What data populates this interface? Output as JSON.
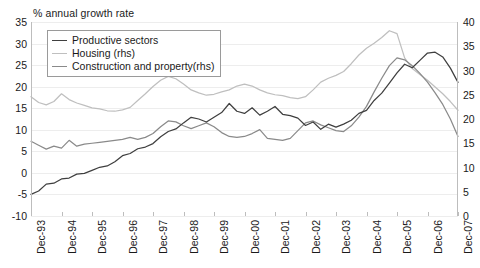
{
  "chart_data": {
    "type": "line",
    "title": "% annual growth rate",
    "xlabel": "",
    "ylabel": "% annual growth rate",
    "ylabel_right": "",
    "grid": true,
    "legend_position": "top-left",
    "ylim": [
      -10,
      35
    ],
    "ylim_right": [
      0,
      40
    ],
    "yticks": [
      35,
      30,
      25,
      20,
      15,
      10,
      5,
      0,
      -5,
      -10
    ],
    "yticks_right": [
      40,
      35,
      30,
      25,
      20,
      15,
      10,
      5,
      0
    ],
    "categories": [
      "Dec-93",
      "Dec-94",
      "Dec-95",
      "Dec-96",
      "Dec-97",
      "Dec-98",
      "Dec-99",
      "Dec-00",
      "Dec-01",
      "Dec-02",
      "Dec-03",
      "Dec-04",
      "Dec-05",
      "Dec-06",
      "Dec-07"
    ],
    "x_tick_labels": [
      "Dec-93",
      "Dec-94",
      "Dec-95",
      "Dec-96",
      "Dec-97",
      "Dec-98",
      "Dec-99",
      "Dec-00",
      "Dec-01",
      "Dec-02",
      "Dec-03",
      "Dec-04",
      "Dec-05",
      "Dec-06",
      "Dec-07"
    ],
    "x_start": "Dec-93",
    "x_end": "Dec-07",
    "series": [
      {
        "name": "Productive sectors",
        "axis": "left",
        "color": "#3f3f3f",
        "x": [
          0.0,
          0.25,
          0.5,
          0.75,
          1.0,
          1.25,
          1.5,
          1.75,
          2.0,
          2.25,
          2.5,
          2.75,
          3.0,
          3.25,
          3.5,
          3.75,
          4.0,
          4.25,
          4.5,
          4.75,
          5.0,
          5.25,
          5.5,
          5.75,
          6.0,
          6.25,
          6.5,
          6.75,
          7.0,
          7.25,
          7.5,
          7.75,
          8.0,
          8.25,
          8.5,
          8.75,
          9.0,
          9.25,
          9.5,
          9.75,
          10.0,
          10.25,
          10.5,
          10.75,
          11.0,
          11.25,
          11.5,
          11.75,
          12.0,
          12.25,
          12.5,
          12.75,
          13.0,
          13.25,
          13.5,
          13.75,
          14.0
        ],
        "values": [
          -5.0,
          -4.2,
          -2.6,
          -2.4,
          -1.4,
          -1.2,
          -0.3,
          -0.1,
          0.6,
          1.3,
          1.6,
          2.6,
          4.0,
          4.5,
          5.6,
          6.0,
          6.8,
          8.4,
          9.6,
          10.2,
          11.6,
          12.9,
          12.5,
          11.8,
          12.9,
          14.0,
          16.1,
          14.3,
          13.8,
          15.1,
          13.4,
          14.3,
          15.4,
          13.6,
          13.3,
          12.7,
          11.0,
          11.8,
          10.1,
          11.3,
          10.6,
          11.3,
          12.2,
          13.8,
          14.5,
          16.8,
          18.5,
          20.8,
          23.2,
          25.2,
          24.4,
          26.1,
          27.8,
          28.0,
          26.9,
          24.3,
          21.0
        ],
        "y_unit": "% annual growth"
      },
      {
        "name": "Housing (rhs)",
        "axis": "right",
        "color": "#bfbfbf",
        "x": [
          0.0,
          0.25,
          0.5,
          0.75,
          1.0,
          1.25,
          1.5,
          1.75,
          2.0,
          2.25,
          2.5,
          2.75,
          3.0,
          3.25,
          3.5,
          3.75,
          4.0,
          4.25,
          4.5,
          4.75,
          5.0,
          5.25,
          5.5,
          5.75,
          6.0,
          6.25,
          6.5,
          6.75,
          7.0,
          7.25,
          7.5,
          7.75,
          8.0,
          8.25,
          8.5,
          8.75,
          9.0,
          9.25,
          9.5,
          9.75,
          10.0,
          10.25,
          10.5,
          10.75,
          11.0,
          11.25,
          11.5,
          11.75,
          12.0,
          12.25,
          12.5,
          12.75,
          13.0,
          13.25,
          13.5,
          13.75,
          14.0
        ],
        "values": [
          24.6,
          23.4,
          22.9,
          23.6,
          25.2,
          24.0,
          23.3,
          22.8,
          22.3,
          22.1,
          21.7,
          21.6,
          21.9,
          22.4,
          23.8,
          25.2,
          26.7,
          28.0,
          28.8,
          28.3,
          27.2,
          26.0,
          25.4,
          24.9,
          25.1,
          25.6,
          26.0,
          26.8,
          27.2,
          26.8,
          26.0,
          25.4,
          25.0,
          24.8,
          24.4,
          24.2,
          24.6,
          26.0,
          27.6,
          28.4,
          29.0,
          29.8,
          31.4,
          33.2,
          34.6,
          35.6,
          36.8,
          38.2,
          37.6,
          32.6,
          30.4,
          29.2,
          28.0,
          26.6,
          25.2,
          23.6,
          21.8
        ],
        "y_unit": "% annual growth (rhs)"
      },
      {
        "name": "Construction and property(rhs)",
        "axis": "right",
        "color": "#8a8a8a",
        "x": [
          0.0,
          0.25,
          0.5,
          0.75,
          1.0,
          1.25,
          1.5,
          1.75,
          2.0,
          2.25,
          2.5,
          2.75,
          3.0,
          3.25,
          3.5,
          3.75,
          4.0,
          4.25,
          4.5,
          4.75,
          5.0,
          5.25,
          5.5,
          5.75,
          6.0,
          6.25,
          6.5,
          6.75,
          7.0,
          7.25,
          7.5,
          7.75,
          8.0,
          8.25,
          8.5,
          8.75,
          9.0,
          9.25,
          9.5,
          9.75,
          10.0,
          10.25,
          10.5,
          10.75,
          11.0,
          11.25,
          11.5,
          11.75,
          12.0,
          12.25,
          12.5,
          12.75,
          13.0,
          13.25,
          13.5,
          13.75,
          14.0
        ],
        "values": [
          15.4,
          14.6,
          13.8,
          14.4,
          14.0,
          15.6,
          14.4,
          14.8,
          15.0,
          15.2,
          15.4,
          15.6,
          15.8,
          16.2,
          15.8,
          16.2,
          17.0,
          18.4,
          19.6,
          19.4,
          18.6,
          18.0,
          18.6,
          19.2,
          18.4,
          17.2,
          16.4,
          16.2,
          16.4,
          17.0,
          17.8,
          16.0,
          15.8,
          15.6,
          16.0,
          17.6,
          19.2,
          19.6,
          18.8,
          18.2,
          17.6,
          17.4,
          18.6,
          20.4,
          22.6,
          25.6,
          28.4,
          31.0,
          32.6,
          32.2,
          31.0,
          29.4,
          27.6,
          25.4,
          23.0,
          20.0,
          16.4
        ],
        "y_unit": "% annual growth (rhs)"
      }
    ]
  },
  "legend": {
    "items": [
      {
        "label": "Productive sectors",
        "color": "#3f3f3f"
      },
      {
        "label": "Housing (rhs)",
        "color": "#bfbfbf"
      },
      {
        "label": "Construction and property(rhs)",
        "color": "#8a8a8a"
      }
    ]
  }
}
